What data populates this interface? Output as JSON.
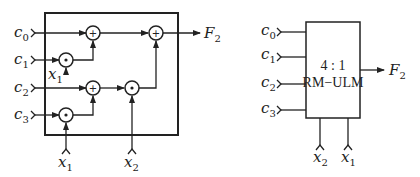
{
  "left_diagram": {
    "inputs": [
      {
        "name": "c",
        "sub": "0"
      },
      {
        "name": "c",
        "sub": "1"
      },
      {
        "name": "c",
        "sub": "2"
      },
      {
        "name": "c",
        "sub": "3"
      }
    ],
    "select_inner": {
      "name": "x",
      "sub": "1"
    },
    "select_bottom": [
      {
        "name": "x",
        "sub": "1"
      },
      {
        "name": "x",
        "sub": "2"
      }
    ],
    "output": {
      "name": "F",
      "sub": "2"
    },
    "ops": {
      "xor": "+",
      "and": "•"
    }
  },
  "right_diagram": {
    "inputs": [
      {
        "name": "c",
        "sub": "0"
      },
      {
        "name": "c",
        "sub": "1"
      },
      {
        "name": "c",
        "sub": "2"
      },
      {
        "name": "c",
        "sub": "3"
      }
    ],
    "block_line1": "4 : 1",
    "block_line2": "RM−ULM",
    "selects": [
      {
        "name": "x",
        "sub": "2"
      },
      {
        "name": "x",
        "sub": "1"
      }
    ],
    "output": {
      "name": "F",
      "sub": "2"
    }
  }
}
